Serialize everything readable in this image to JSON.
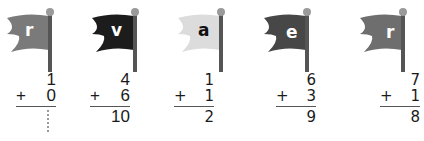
{
  "problems": [
    {
      "flag": {
        "letter": "r",
        "color": "#7a7a7a",
        "letter_color": "#ffffff"
      },
      "top": "1",
      "op": "+",
      "bottom": "0",
      "answer": "",
      "answer_placeholder": "dotted",
      "left": 12
    },
    {
      "flag": {
        "letter": "v",
        "color": "#1c1c1c",
        "letter_color": "#ffffff"
      },
      "top": "4",
      "op": "+",
      "bottom": "6",
      "answer": "10",
      "left": 96
    },
    {
      "flag": {
        "letter": "a",
        "color": "#dcdcdc",
        "letter_color": "#111111"
      },
      "top": "1",
      "op": "+",
      "bottom": "1",
      "answer": "2",
      "left": 182
    },
    {
      "flag": {
        "letter": "e",
        "color": "#474747",
        "letter_color": "#ffffff"
      },
      "top": "6",
      "op": "+",
      "bottom": "3",
      "answer": "9",
      "left": 268
    },
    {
      "flag": {
        "letter": "r",
        "color": "#6e6e6e",
        "letter_color": "#ffffff"
      },
      "top": "7",
      "op": "+",
      "bottom": "1",
      "answer": "8",
      "left": 350
    }
  ],
  "pole_color": "#555555",
  "knob_color": "#9a9a9a"
}
